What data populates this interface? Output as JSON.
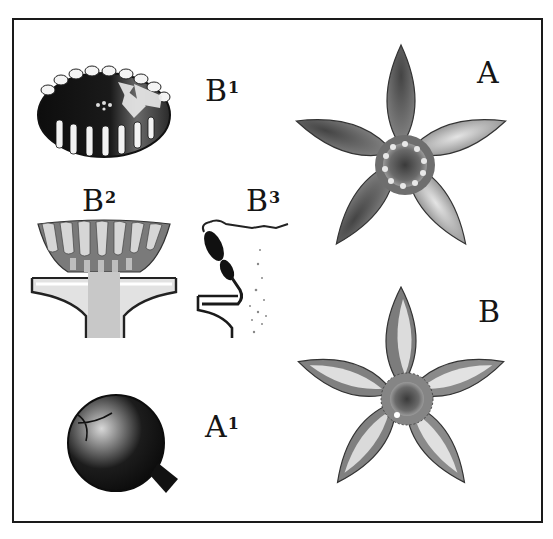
{
  "plate": {
    "description": "Botanical illustration plate with six labeled figures",
    "colors": {
      "ink": "#151515",
      "paper": "#ffffff",
      "stipple_mid": "#6e6e6e",
      "stipple_light": "#b5b5b5"
    }
  },
  "figures": [
    {
      "id": "B1",
      "letter": "B",
      "index": "1",
      "subject": "corona-top-view"
    },
    {
      "id": "B2",
      "letter": "B",
      "index": "2",
      "subject": "corona-section"
    },
    {
      "id": "B3",
      "letter": "B",
      "index": "3",
      "subject": "pollinium-section"
    },
    {
      "id": "A",
      "letter": "A",
      "index": "",
      "subject": "flower-a"
    },
    {
      "id": "B",
      "letter": "B",
      "index": "",
      "subject": "flower-b"
    },
    {
      "id": "A1",
      "letter": "A",
      "index": "1",
      "subject": "fruit-bud"
    }
  ]
}
